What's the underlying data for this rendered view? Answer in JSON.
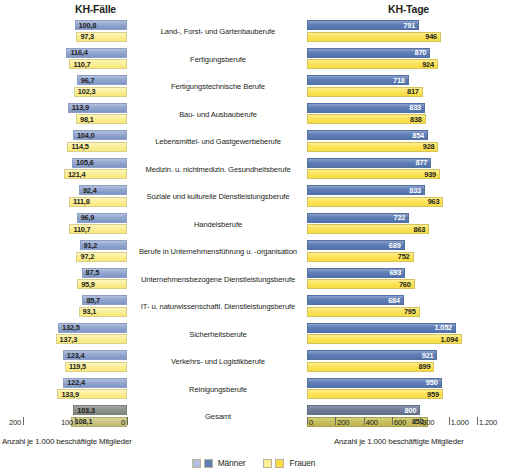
{
  "panels": {
    "left": {
      "title": "KH-Fälle",
      "caption": "Anzahl je 1.000 beschäftigte Mitglieder"
    },
    "right": {
      "title": "KH-Tage",
      "caption": "Anzahl je 1.000 beschäftigte Mitglieder"
    }
  },
  "legend": [
    {
      "label": "Männer",
      "color_light": "#b3c0dd",
      "color_dark": "#5f7db5"
    },
    {
      "label": "Frauen",
      "color_light": "#fbee97",
      "color_dark": "#f7dc43"
    }
  ],
  "axes": {
    "left": {
      "ticks": [
        "200",
        "100",
        "0"
      ],
      "values": [
        200,
        100,
        0
      ],
      "min": 0,
      "max": 200,
      "reversed": true
    },
    "right": {
      "ticks": [
        "0",
        "200",
        "400",
        "600",
        "800",
        "1.000",
        "1.200"
      ],
      "values": [
        0,
        200,
        400,
        600,
        800,
        1000,
        1200
      ],
      "min": 0,
      "max": 1200,
      "reversed": false
    }
  },
  "chart_data": {
    "type": "bar",
    "orientation": "horizontal",
    "layout": "back-to-back dual panel",
    "xlabel": "Anzahl je 1.000 beschäftigte Mitglieder",
    "ylabel": "",
    "categories": [
      "Land-, Forst- und Gartenbauberufe",
      "Fertigungsberufe",
      "Fertigungstechnische Berufe",
      "Bau- und Ausbauberufe",
      "Lebensmittel- und Gastgewerbeberufe",
      "Medizin. u. nichtmedizin. Gesundheitsberufe",
      "Soziale und kulturelle Dienstleistungsberufe",
      "Handelsberufe",
      "Berufe in Unternehmensführung u. -organisation",
      "Unternehmensbezogene Dienstleistungsberufe",
      "IT- u. naturwissenschaftl. Dienstleistungsberufe",
      "Sicherheitsberufe",
      "Verkehrs- und Logistikberufe",
      "Reinigungsberufe",
      "Gesamt"
    ],
    "panels": [
      {
        "name": "KH-Fälle",
        "xlim": [
          0,
          200
        ],
        "series": [
          {
            "name": "Männer",
            "values": [
              100.8,
              116.4,
              96.7,
              113.9,
              104.0,
              105.6,
              92.4,
              96.9,
              91.2,
              87.5,
              85.7,
              132.5,
              123.4,
              122.4,
              103.3
            ],
            "labels": [
              "100,8",
              "116,4",
              "96,7",
              "113,9",
              "104,0",
              "105,6",
              "92,4",
              "96,9",
              "91,2",
              "87,5",
              "85,7",
              "132,5",
              "123,4",
              "122,4",
              "103,3"
            ]
          },
          {
            "name": "Frauen",
            "values": [
              97.3,
              110.7,
              102.3,
              98.1,
              114.5,
              121.4,
              111.8,
              110.7,
              97.2,
              95.9,
              93.1,
              137.3,
              119.5,
              133.9,
              108.1
            ],
            "labels": [
              "97,3",
              "110,7",
              "102,3",
              "98,1",
              "114,5",
              "121,4",
              "111,8",
              "110,7",
              "97,2",
              "95,9",
              "93,1",
              "137,3",
              "119,5",
              "133,9",
              "108,1"
            ]
          }
        ]
      },
      {
        "name": "KH-Tage",
        "xlim": [
          0,
          1200
        ],
        "series": [
          {
            "name": "Männer",
            "values": [
              791,
              870,
              718,
              833,
              854,
              877,
              833,
              722,
              689,
              693,
              684,
              1052,
              921,
              950,
              800
            ],
            "labels": [
              "791",
              "870",
              "718",
              "833",
              "854",
              "877",
              "833",
              "722",
              "689",
              "693",
              "684",
              "1.052",
              "921",
              "950",
              "800"
            ]
          },
          {
            "name": "Frauen",
            "values": [
              946,
              924,
              817,
              838,
              928,
              939,
              963,
              863,
              752,
              760,
              795,
              1094,
              899,
              959,
              852
            ],
            "labels": [
              "946",
              "924",
              "817",
              "838",
              "928",
              "939",
              "963",
              "863",
              "752",
              "760",
              "795",
              "1.094",
              "899",
              "959",
              "852"
            ]
          }
        ]
      }
    ],
    "total_row_index": 14,
    "grid": false,
    "legend_position": "bottom-center"
  }
}
